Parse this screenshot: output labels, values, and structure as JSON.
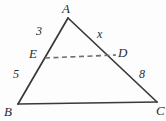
{
  "figure": {
    "kind": "geometry-diagram",
    "background_color": "#fdfdfd",
    "stroke_color": "#3a3a3a",
    "dashed_stroke_color": "#6e6e6e",
    "text_color": "#2b2b2b",
    "vertices": [
      {
        "id": "A",
        "label": "A",
        "x": 68,
        "y": 18
      },
      {
        "id": "B",
        "label": "B",
        "x": 18,
        "y": 104
      },
      {
        "id": "C",
        "label": "C",
        "x": 157,
        "y": 102
      },
      {
        "id": "D",
        "label": "D",
        "x": 116,
        "y": 55
      },
      {
        "id": "E",
        "label": "E",
        "x": 45,
        "y": 58
      }
    ],
    "solid_segments": [
      {
        "id": "AB",
        "from": "A",
        "to": "B"
      },
      {
        "id": "AC",
        "from": "A",
        "to": "C"
      },
      {
        "id": "BC",
        "from": "B",
        "to": "C"
      }
    ],
    "dashed_segments": [
      {
        "id": "ED",
        "from": "E",
        "to": "D"
      }
    ],
    "length_labels": [
      {
        "id": "AE",
        "text": "3",
        "segment": "AE"
      },
      {
        "id": "EB",
        "text": "5",
        "segment": "EB"
      },
      {
        "id": "AD",
        "text": "x",
        "segment": "AD"
      },
      {
        "id": "DC",
        "text": "8",
        "segment": "DC"
      }
    ]
  }
}
